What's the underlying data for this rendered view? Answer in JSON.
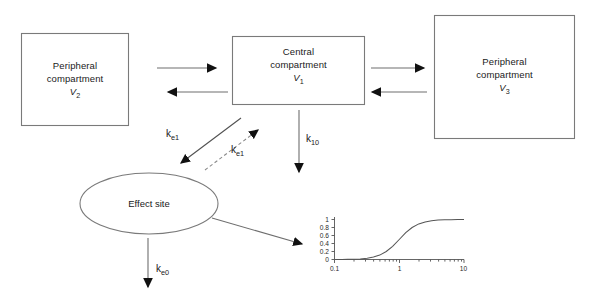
{
  "diagram": {
    "compartments": [
      {
        "id": "peripheral-2",
        "line1": "Peripheral",
        "line2": "compartment",
        "volume_symbol": "V",
        "volume_subscript": "2",
        "shape": "rectangle"
      },
      {
        "id": "central-1",
        "line1": "Central",
        "line2": "compartment",
        "volume_symbol": "V",
        "volume_subscript": "1",
        "shape": "rectangle"
      },
      {
        "id": "peripheral-3",
        "line1": "Peripheral",
        "line2": "compartment",
        "volume_symbol": "V",
        "volume_subscript": "3",
        "shape": "rectangle"
      }
    ],
    "effect_site": {
      "label": "Effect site",
      "shape": "ellipse"
    },
    "rate_constants": [
      {
        "id": "ke1-solid",
        "base": "k",
        "sub": "e1",
        "style": "solid"
      },
      {
        "id": "ke1-dashed",
        "base": "k",
        "sub": "e1",
        "style": "dashed"
      },
      {
        "id": "k10",
        "base": "k",
        "sub": "10",
        "style": "solid"
      },
      {
        "id": "ke0",
        "base": "k",
        "sub": "e0",
        "style": "solid"
      }
    ],
    "colors": {
      "box_stroke": "#7a7a7a",
      "arrow_line": "#6e6e6e",
      "arrow_head": "#111111",
      "text": "#1a1a1a",
      "background": "#ffffff",
      "curve": "#555555",
      "axis": "#555555"
    }
  },
  "chart_data": {
    "type": "line",
    "title": "",
    "xlabel": "",
    "ylabel": "",
    "xscale": "log",
    "xlim": [
      0.1,
      10
    ],
    "ylim": [
      0,
      1
    ],
    "xticks": [
      0.1,
      1,
      10
    ],
    "xtick_labels": [
      "0.1",
      "1",
      "10"
    ],
    "yticks": [
      0,
      0.2,
      0.4,
      0.6,
      0.8,
      1
    ],
    "ytick_labels": [
      "0",
      "0.2",
      "0.4",
      "0.6",
      "0.8",
      "1"
    ],
    "grid": false,
    "legend": false,
    "series": [
      {
        "name": "effect",
        "x": [
          0.1,
          0.13,
          0.16,
          0.2,
          0.25,
          0.32,
          0.4,
          0.5,
          0.63,
          0.79,
          1.0,
          1.26,
          1.58,
          2.0,
          2.51,
          3.16,
          3.98,
          5.01,
          6.31,
          7.94,
          10.0
        ],
        "y": [
          0.001,
          0.002,
          0.004,
          0.008,
          0.015,
          0.031,
          0.06,
          0.11,
          0.2,
          0.33,
          0.5,
          0.67,
          0.8,
          0.89,
          0.94,
          0.969,
          0.985,
          0.992,
          0.996,
          0.998,
          0.999
        ]
      }
    ]
  }
}
